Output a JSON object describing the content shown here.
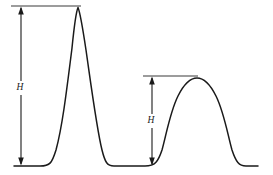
{
  "figure": {
    "background_color": "#ffffff",
    "curve_color": "#1a1a1a",
    "reference_line_color": "#3a3a3a",
    "annotation_color": "#1a1a1a",
    "width": 273,
    "height": 175
  },
  "annotations": [
    {
      "id": "large-peak-height",
      "label": "H",
      "label_x": 20,
      "label_y": 88,
      "arrow_x": 21,
      "arrow_top_y": 8,
      "arrow_bottom_y": 164,
      "reference_line": {
        "x1": 11,
        "x2": 81,
        "y": 6
      }
    },
    {
      "id": "small-peak-height",
      "label": "H",
      "label_x": 151,
      "label_y": 121,
      "arrow_x": 152,
      "arrow_top_y": 78,
      "arrow_bottom_y": 164,
      "reference_line": {
        "x1": 143,
        "x2": 198,
        "y": 76
      }
    }
  ],
  "chart_data": {
    "type": "line",
    "xlabel": "",
    "ylabel": "",
    "xlim": [
      0,
      273
    ],
    "ylim": [
      175,
      0
    ],
    "grid": false,
    "legend": null,
    "baseline_y": 166,
    "series": [
      {
        "name": "detector-signal",
        "color": "#1a1a1a",
        "peaks": [
          {
            "name": "large-peak",
            "apex_x": 78,
            "apex_y": 7,
            "height": 159,
            "start_x": 14,
            "end_x": 110
          },
          {
            "name": "small-peak",
            "apex_x": 197,
            "apex_y": 78,
            "height": 88,
            "start_x": 160,
            "end_x": 257
          }
        ],
        "path": "M 14,166 L 40,166 C 50,166 52,163 56,150 C 62,128 66,96 72,48 C 74,28 76,12 78,7.5 C 80,12 83,30 86,50 C 92,92 97,130 102,150 C 105,162 107,166 114,166 L 145,166 C 155,166 158,162 162,150 C 166,136 170,112 178,96 C 184,84 191,78 197,78 C 203,78 210,84 216,96 C 224,112 228,136 232,150 C 236,162 239,166 246,166 L 258,166"
      }
    ]
  }
}
